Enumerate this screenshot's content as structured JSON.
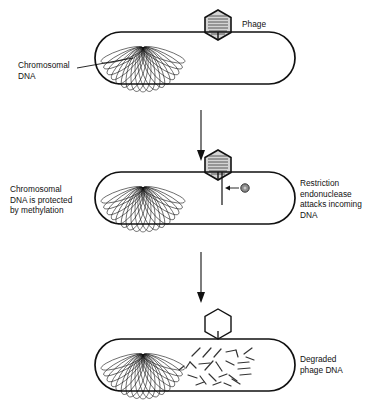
{
  "diagram": {
    "stages": [
      {
        "id": "stage-1-attachment",
        "cell": {
          "x": 95,
          "y": 32,
          "width": 200,
          "height": 52
        },
        "labels": {
          "left": {
            "text": "Chromosomal\nDNA",
            "lines": [
              "Chromosomal",
              "DNA"
            ],
            "x": 18,
            "y": 64
          },
          "right": {
            "text": "Phage",
            "lines": [
              "Phage"
            ],
            "x": 242,
            "y": 28
          }
        },
        "phage": {
          "x": 218,
          "y": 8,
          "head": "filled",
          "tail_length": 18
        },
        "chromosome": {
          "cx": 143,
          "cy": 70,
          "rx": 35,
          "ry": 24,
          "loops": 17
        }
      },
      {
        "id": "stage-2-restriction",
        "cell": {
          "x": 95,
          "y": 172,
          "width": 200,
          "height": 52
        },
        "labels": {
          "left": {
            "text": "Chromosomal\nDNA is protected\nby methylation",
            "lines": [
              "Chromosomal",
              "DNA is protected",
              "by methylation"
            ],
            "x": 10,
            "y": 188
          },
          "right": {
            "text": "Restriction\nendonuclease\nattacks incoming\nDNA",
            "lines": [
              "Restriction",
              "endonuclease",
              "attacks incoming",
              "DNA"
            ],
            "x": 300,
            "y": 182
          }
        },
        "phage": {
          "x": 218,
          "y": 148,
          "head": "filled",
          "tail_length": 18
        },
        "chromosome": {
          "cx": 143,
          "cy": 210,
          "rx": 35,
          "ry": 24,
          "loops": 17
        },
        "injected_dna": {
          "x": 222,
          "y_top": 172,
          "y_bottom": 205
        },
        "endonuclease": {
          "cx": 245,
          "cy": 188,
          "r": 4.2,
          "color": "#8c8c8c"
        }
      },
      {
        "id": "stage-3-degraded",
        "cell": {
          "x": 95,
          "y": 339,
          "width": 200,
          "height": 52
        },
        "labels": {
          "right": {
            "text": "Degraded\nphage DNA",
            "lines": [
              "Degraded",
              "phage DNA"
            ],
            "x": 300,
            "y": 358
          }
        },
        "phage": {
          "x": 218,
          "y": 307,
          "head": "empty",
          "tail_length": 18
        },
        "chromosome": {
          "cx": 143,
          "cy": 377,
          "rx": 35,
          "ry": 24,
          "loops": 17
        },
        "fragment_count": 26
      }
    ],
    "flow_arrows": [
      {
        "id": "arrow-stage1-to-stage2",
        "x": 201,
        "y_top": 110,
        "y_bottom": 160
      },
      {
        "id": "arrow-stage2-to-stage3",
        "x": 201,
        "y_top": 252,
        "y_bottom": 302
      }
    ],
    "colors": {
      "stroke": "#111111",
      "text": "#111111",
      "background": "#ffffff",
      "phage_head_fill": "#d4d4d4",
      "endonuclease_fill": "#8c8c8c"
    }
  }
}
